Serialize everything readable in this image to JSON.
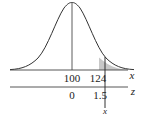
{
  "diagram": {
    "type": "normal-distribution",
    "mean_label": "100",
    "value_label": "124",
    "x_axis_label": "x",
    "z_axis_label": "z",
    "z_mean_label": "0",
    "z_value_label": "1.5",
    "marker_label": "x",
    "shaded_region": "right tail beyond 124",
    "colors": {
      "curve": "#333333",
      "shade": "#c8c8c8",
      "axis": "#444444"
    }
  }
}
